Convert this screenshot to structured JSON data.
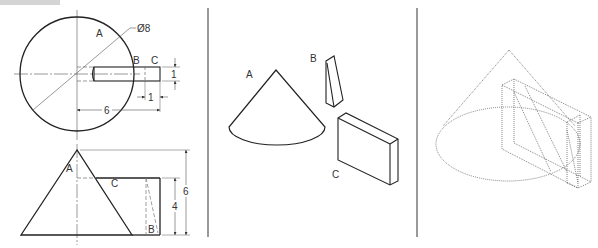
{
  "figure": {
    "header_bar": "",
    "panels": [
      {
        "id": "orthographic",
        "views": [
          "top-view",
          "front-view"
        ],
        "labels": {
          "A_top": "A",
          "B_top": "B",
          "C_top": "C",
          "A_front": "A",
          "B_front": "B",
          "C_front": "C"
        },
        "dimensions": {
          "diameter": "Ø8",
          "offset": "6",
          "slot_depth": "1",
          "slot_width": "1",
          "height_total": "6",
          "height_block": "4"
        }
      },
      {
        "id": "exploded-isometric",
        "labels": {
          "cone": "A",
          "wedge": "B",
          "block": "C"
        }
      },
      {
        "id": "assembled-isometric",
        "labels": {}
      }
    ],
    "colors": {
      "line": "#222222",
      "thin": "#555555",
      "dotted": "#666666",
      "divider": "#555555",
      "header": "#d4d4d4"
    }
  }
}
